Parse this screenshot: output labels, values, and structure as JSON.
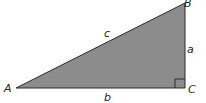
{
  "diagram": {
    "type": "right-triangle",
    "fill_color": "#8c8c8c",
    "stroke_color": "#2a2a2a",
    "vertices": {
      "A": {
        "label": "A",
        "x": 16,
        "y": 88
      },
      "B": {
        "label": "B",
        "x": 185,
        "y": 3
      },
      "C": {
        "label": "C",
        "x": 185,
        "y": 88
      }
    },
    "sides": {
      "a": {
        "label": "a",
        "between": "B-C"
      },
      "b": {
        "label": "b",
        "between": "A-C"
      },
      "c": {
        "label": "c",
        "between": "A-B"
      }
    },
    "right_angle_at": "C"
  }
}
